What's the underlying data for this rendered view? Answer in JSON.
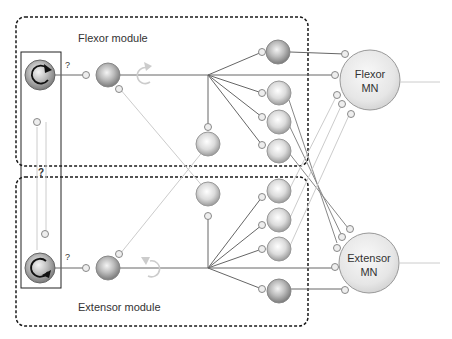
{
  "labels": {
    "flexor_module": "Flexor module",
    "extensor_module": "Extensor module",
    "flexor_mn_line1": "Flexor",
    "flexor_mn_line2": "MN",
    "extensor_mn_line1": "Extensor",
    "extensor_mn_line2": "MN",
    "question_flexor": "?",
    "question_extensor": "?",
    "question_middle": "?"
  },
  "colors": {
    "dashed_border": "#1a1a1a",
    "strong_line": "#666666",
    "faint_line": "#cccccc",
    "neuron_fill_dark": "#9a9a9a",
    "neuron_fill_light": "#f2f2f2"
  }
}
